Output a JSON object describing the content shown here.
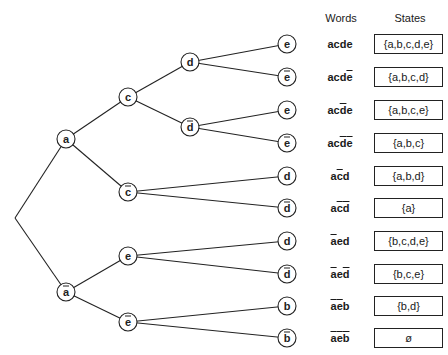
{
  "headers": {
    "words": "Words",
    "states": "States"
  },
  "colors": {
    "stroke": "#222222",
    "background": "#ffffff"
  },
  "tree": {
    "root": "",
    "nodes": [
      {
        "id": "a",
        "label": "a",
        "bar": false,
        "parent": "root"
      },
      {
        "id": "abar",
        "label": "a",
        "bar": true,
        "parent": "root"
      },
      {
        "id": "c",
        "label": "c",
        "bar": false,
        "parent": "a"
      },
      {
        "id": "cbar",
        "label": "c",
        "bar": true,
        "parent": "a"
      },
      {
        "id": "e1",
        "label": "e",
        "bar": false,
        "parent": "abar"
      },
      {
        "id": "ebar1",
        "label": "e",
        "bar": true,
        "parent": "abar"
      },
      {
        "id": "d1",
        "label": "d",
        "bar": false,
        "parent": "c"
      },
      {
        "id": "dbar1",
        "label": "d",
        "bar": true,
        "parent": "c"
      }
    ],
    "leaves": [
      {
        "label": "e",
        "bar": false,
        "parent": "d1"
      },
      {
        "label": "e",
        "bar": true,
        "parent": "d1"
      },
      {
        "label": "e",
        "bar": false,
        "parent": "dbar1"
      },
      {
        "label": "e",
        "bar": true,
        "parent": "dbar1"
      },
      {
        "label": "d",
        "bar": false,
        "parent": "cbar"
      },
      {
        "label": "d",
        "bar": true,
        "parent": "cbar"
      },
      {
        "label": "d",
        "bar": false,
        "parent": "e1"
      },
      {
        "label": "d",
        "bar": true,
        "parent": "e1"
      },
      {
        "label": "b",
        "bar": false,
        "parent": "ebar1"
      },
      {
        "label": "b",
        "bar": true,
        "parent": "ebar1"
      }
    ]
  },
  "rows": [
    {
      "word": [
        [
          "a",
          0
        ],
        [
          "c",
          0
        ],
        [
          "d",
          0
        ],
        [
          "e",
          0
        ]
      ],
      "word_text": "acde",
      "state": "{a,b,c,d,e}"
    },
    {
      "word": [
        [
          "a",
          0
        ],
        [
          "c",
          0
        ],
        [
          "d",
          0
        ],
        [
          "e",
          1
        ]
      ],
      "word_text": "acdē",
      "state": "{a,b,c,d}"
    },
    {
      "word": [
        [
          "a",
          0
        ],
        [
          "c",
          0
        ],
        [
          "d",
          1
        ],
        [
          "e",
          0
        ]
      ],
      "word_text": "acd̄e",
      "state": "{a,b,c,e}"
    },
    {
      "word": [
        [
          "a",
          0
        ],
        [
          "c",
          0
        ],
        [
          "d",
          1
        ],
        [
          "e",
          1
        ]
      ],
      "word_text": "acd̄ē",
      "state": "{a,b,c}"
    },
    {
      "word": [
        [
          "a",
          0
        ],
        [
          "c",
          1
        ],
        [
          "d",
          0
        ]
      ],
      "word_text": "ac̄d",
      "state": "{a,b,d}"
    },
    {
      "word": [
        [
          "a",
          0
        ],
        [
          "c",
          1
        ],
        [
          "d",
          1
        ]
      ],
      "word_text": "ac̄d̄",
      "state": "{a}"
    },
    {
      "word": [
        [
          "a",
          1
        ],
        [
          "e",
          0
        ],
        [
          "d",
          0
        ]
      ],
      "word_text": "āed",
      "state": "{b,c,d,e}"
    },
    {
      "word": [
        [
          "a",
          1
        ],
        [
          "e",
          0
        ],
        [
          "d",
          1
        ]
      ],
      "word_text": "āed̄",
      "state": "{b,c,e}"
    },
    {
      "word": [
        [
          "a",
          1
        ],
        [
          "e",
          1
        ],
        [
          "b",
          0
        ]
      ],
      "word_text": "āēb",
      "state": "{b,d}"
    },
    {
      "word": [
        [
          "a",
          1
        ],
        [
          "e",
          1
        ],
        [
          "b",
          1
        ]
      ],
      "word_text": "āēb̄",
      "state": "ø"
    }
  ]
}
